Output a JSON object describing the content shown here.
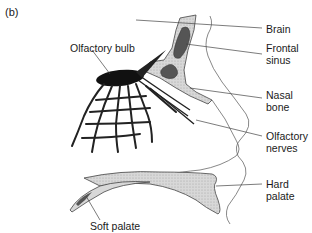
{
  "figure": {
    "panel_label": "(b)",
    "labels": {
      "olfactory_bulb": "Olfactory bulb",
      "brain": "Brain",
      "frontal_sinus_1": "Frontal",
      "frontal_sinus_2": "sinus",
      "nasal_bone_1": "Nasal",
      "nasal_bone_2": "bone",
      "olfactory_nerves_1": "Olfactory",
      "olfactory_nerves_2": "nerves",
      "hard_palate_1": "Hard",
      "hard_palate_2": "palate",
      "soft_palate": "Soft palate"
    },
    "colors": {
      "bone_fill": "#d4d4d4",
      "sinus_fill": "#5a5a5a",
      "bulb_fill": "#111111",
      "line": "#333333"
    }
  }
}
